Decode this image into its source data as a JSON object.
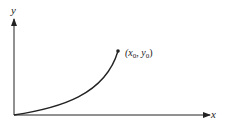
{
  "diagram": {
    "axes": {
      "x_label": "x",
      "y_label": "y",
      "origin": [
        14,
        115
      ],
      "x_end": [
        210,
        115
      ],
      "y_end": [
        14,
        18
      ]
    },
    "curve": {
      "description": "increasing convex curve from origin to point",
      "start": [
        14,
        115
      ],
      "end": [
        118,
        51
      ]
    },
    "point": {
      "label_prefix": "(x",
      "sub0": "0",
      "mid": ", y",
      "sub1": "0",
      "suffix": ")"
    },
    "colors": {
      "stroke": "#222222",
      "background": "#ffffff"
    }
  }
}
